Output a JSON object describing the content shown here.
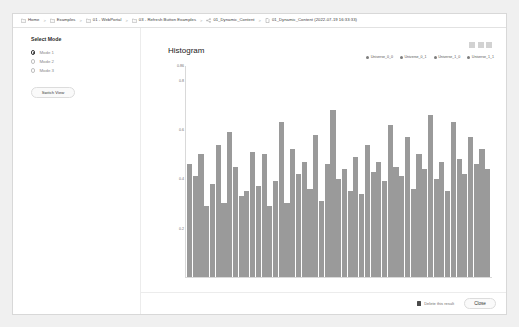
{
  "breadcrumb": {
    "items": [
      {
        "label": "Home",
        "icon": "folder-icon"
      },
      {
        "label": "Examples",
        "icon": "folder-icon"
      },
      {
        "label": "01 - WebPortal",
        "icon": "folder-icon"
      },
      {
        "label": "03 - Refresh Button Examples",
        "icon": "folder-icon"
      },
      {
        "label": "01_Dynamic_Content",
        "icon": "share-nodes-icon"
      },
      {
        "label": "01_Dynamic_Content (2022-07-19 16:33:33)",
        "icon": "document-icon"
      }
    ],
    "separator": ">"
  },
  "left_panel": {
    "title": "Select Mode",
    "options": [
      {
        "label": "Mode 1",
        "selected": true
      },
      {
        "label": "Mode 2",
        "selected": false
      },
      {
        "label": "Mode 3",
        "selected": false
      }
    ],
    "switch_view_label": "Switch View"
  },
  "chart_panel": {
    "toolbar_buttons": [
      "tool-1",
      "tool-2",
      "tool-3"
    ]
  },
  "footer": {
    "checkbox_label": "Delete this result",
    "checkbox_checked": true,
    "close_label": "Close"
  },
  "colors": {
    "bar": "#9a9a9a",
    "axis": "#d9d9d9",
    "legend_dot": "#7d7d7d",
    "panel_border": "#ececec"
  },
  "chart_data": {
    "type": "bar",
    "title": "Histogram",
    "xlabel": "",
    "ylabel": "",
    "ylim": [
      0,
      0.86
    ],
    "grid": false,
    "legend_position": "top-right",
    "yticks": [
      0.86,
      0.8,
      0.6,
      0.4,
      0.2
    ],
    "ytick_labels": [
      "0.86",
      "0.8",
      "0.6",
      "0.4",
      "0.2"
    ],
    "legend": [
      "Universe_0_0",
      "Universe_0_1",
      "Universe_1_0",
      "Universe_1_1"
    ],
    "categories": [
      "1",
      "2",
      "3",
      "4",
      "5",
      "6",
      "7",
      "8",
      "9",
      "10",
      "11",
      "12",
      "13",
      "14",
      "15",
      "16",
      "17",
      "18",
      "19",
      "20",
      "21",
      "22",
      "23",
      "24",
      "25",
      "26",
      "27",
      "28",
      "29",
      "30",
      "31",
      "32",
      "33",
      "34",
      "35",
      "36",
      "37",
      "38",
      "39",
      "40",
      "41",
      "42",
      "43",
      "44",
      "45",
      "46",
      "47",
      "48",
      "49",
      "50",
      "51",
      "52",
      "53"
    ],
    "values": [
      0.46,
      0.41,
      0.5,
      0.29,
      0.38,
      0.54,
      0.3,
      0.59,
      0.45,
      0.33,
      0.35,
      0.51,
      0.37,
      0.5,
      0.29,
      0.39,
      0.63,
      0.3,
      0.52,
      0.42,
      0.47,
      0.36,
      0.58,
      0.31,
      0.46,
      0.68,
      0.4,
      0.44,
      0.35,
      0.49,
      0.34,
      0.54,
      0.43,
      0.47,
      0.39,
      0.62,
      0.45,
      0.41,
      0.57,
      0.36,
      0.5,
      0.44,
      0.66,
      0.4,
      0.47,
      0.35,
      0.63,
      0.48,
      0.42,
      0.57,
      0.46,
      0.52,
      0.44
    ]
  }
}
